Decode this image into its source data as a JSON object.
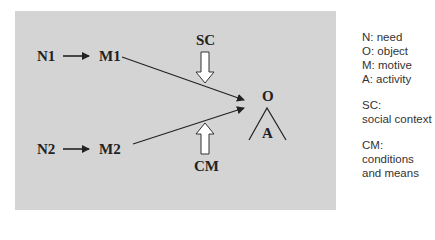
{
  "diagram": {
    "nodes": {
      "n1": "N1",
      "m1": "M1",
      "n2": "N2",
      "m2": "M2",
      "sc": "SC",
      "cm": "CM",
      "o": "O",
      "a": "A"
    },
    "edges": [
      {
        "from": "N1",
        "to": "M1"
      },
      {
        "from": "N2",
        "to": "M2"
      },
      {
        "from": "M1",
        "to": "O"
      },
      {
        "from": "M2",
        "to": "O"
      },
      {
        "from": "SC",
        "to": "O",
        "style": "block-arrow-down"
      },
      {
        "from": "CM",
        "to": "O",
        "style": "block-arrow-up"
      }
    ],
    "colors": {
      "panel": "#d4d4d4",
      "text": "#222222",
      "block_arrow_fill": "#ffffff"
    }
  },
  "legend": {
    "group1": [
      "N: need",
      "O: object",
      "M: motive",
      "A: activity"
    ],
    "group2": [
      "SC:",
      "social context"
    ],
    "group3": [
      "CM:",
      "conditions",
      "and means"
    ]
  }
}
